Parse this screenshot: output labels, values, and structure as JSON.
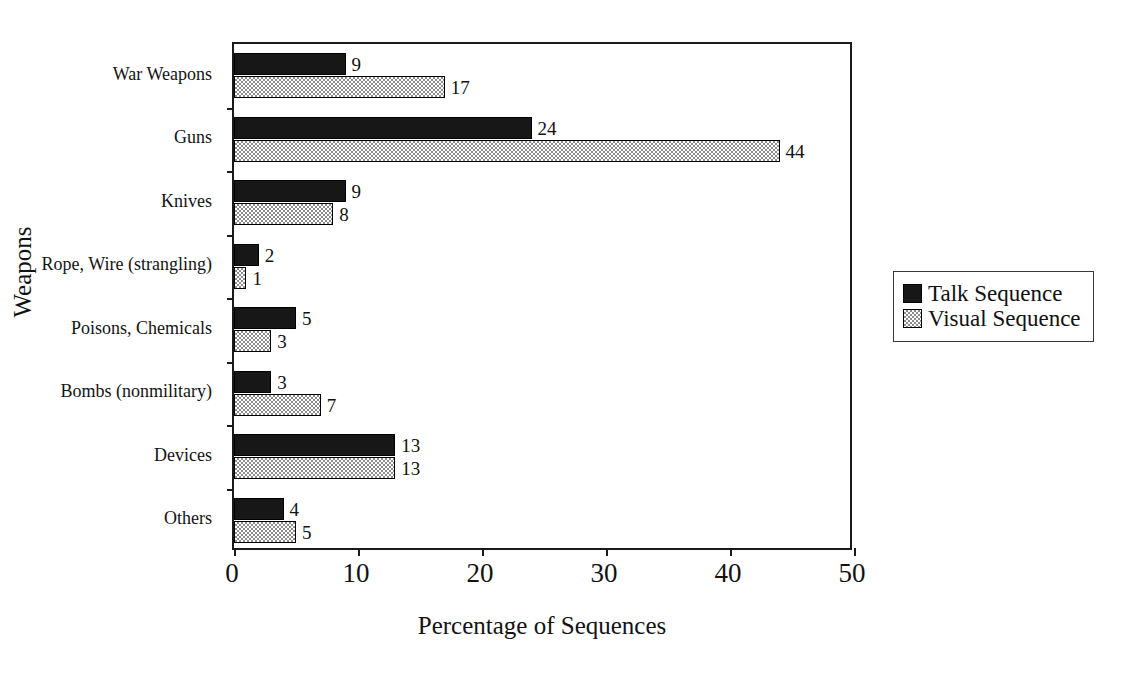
{
  "chart_data": {
    "type": "bar",
    "orientation": "horizontal",
    "title": "",
    "xlabel": "Percentage of Sequences",
    "ylabel": "Weapons",
    "xlim": [
      0,
      50
    ],
    "xticks": [
      0,
      10,
      20,
      30,
      40,
      50
    ],
    "grid": false,
    "legend_position": "right",
    "categories": [
      "War Weapons",
      "Guns",
      "Knives",
      "Rope, Wire (strangling)",
      "Poisons, Chemicals",
      "Bombs (nonmilitary)",
      "Devices",
      "Others"
    ],
    "series": [
      {
        "name": "Talk Sequence",
        "color": "#171717",
        "fill": "solid-black",
        "values": [
          9,
          24,
          9,
          2,
          5,
          3,
          13,
          4
        ]
      },
      {
        "name": "Visual Sequence",
        "color": "#8d8d8d",
        "fill": "checkered-gray",
        "values": [
          17,
          44,
          8,
          1,
          3,
          7,
          13,
          5
        ]
      }
    ]
  },
  "axes": {
    "x_tick_labels": [
      "0",
      "10",
      "20",
      "30",
      "40",
      "50"
    ],
    "x_title": "Percentage of Sequences",
    "y_title": "Weapons"
  },
  "legend": {
    "items": [
      {
        "label": "Talk Sequence",
        "swatch": "solid-black-square"
      },
      {
        "label": "Visual Sequence",
        "swatch": "checkered-gray-square"
      }
    ]
  },
  "colors": {
    "talk_sequence": "#171717",
    "visual_sequence": "#8d8d8d",
    "axis": "#1a1a1a",
    "background": "#ffffff"
  }
}
